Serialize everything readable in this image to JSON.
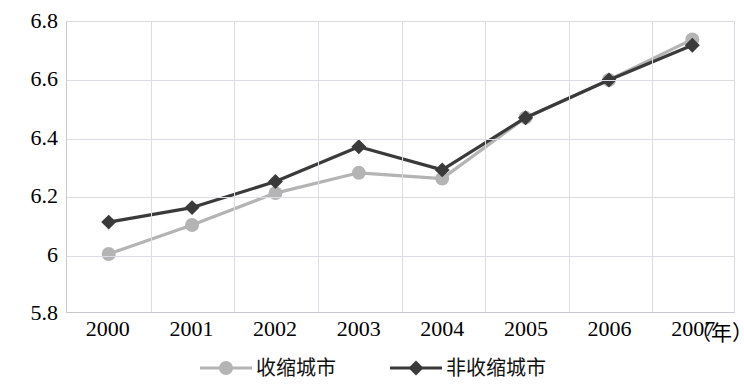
{
  "chart_data": {
    "type": "line",
    "title": "",
    "xlabel": "（年）",
    "ylabel": "",
    "categories": [
      "2000",
      "2001",
      "2002",
      "2003",
      "2004",
      "2005",
      "2006",
      "2007"
    ],
    "series": [
      {
        "name": "收缩城市",
        "color": "#b4b4b4",
        "marker": "circle",
        "values": [
          6.0,
          6.1,
          6.21,
          6.28,
          6.26,
          6.47,
          6.6,
          6.74
        ]
      },
      {
        "name": "非收缩城市",
        "color": "#3a3a3a",
        "marker": "diamond",
        "values": [
          6.11,
          6.16,
          6.25,
          6.37,
          6.29,
          6.47,
          6.6,
          6.72
        ]
      }
    ],
    "ylim": [
      5.8,
      6.8
    ],
    "yticks": [
      "6.8",
      "6.6",
      "6.4",
      "6.2",
      "6",
      "5.8"
    ],
    "ytick_values": [
      6.8,
      6.6,
      6.4,
      6.2,
      6.0,
      5.8
    ],
    "grid": true,
    "legend_position": "bottom"
  },
  "legend": {
    "items": [
      {
        "label": "收缩城市"
      },
      {
        "label": "非收缩城市"
      }
    ]
  }
}
